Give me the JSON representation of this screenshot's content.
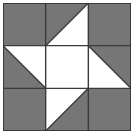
{
  "artwork": {
    "title": "Pinwheel Star Quilt Block",
    "type": "quilt-block-diagram",
    "grid_rows": 3,
    "grid_columns": 3,
    "background_color": "#ffffff",
    "patch_color": "#767676",
    "negative_color": "#ffffff",
    "grid_line_color": "#3a3a3a",
    "outer_border_color": "#2e2e2e",
    "canvas_width": 137,
    "canvas_height": 140,
    "block_left": 3,
    "block_top": 3,
    "block_size": 128,
    "cell_size": 42.667,
    "grid_line_width": 1.4,
    "outer_border_width": 1.6
  },
  "cells": [
    {
      "id": "cell-r1c1",
      "row": 1,
      "column": 1,
      "position_name": "top-left",
      "fill_type": "solid",
      "fill_color": "#767676",
      "description": "solid gray square"
    },
    {
      "id": "cell-r1c2",
      "row": 1,
      "column": 2,
      "position_name": "top-center",
      "fill_type": "half-square-triangle",
      "fill_color": "#767676",
      "triangle_corner": "top-left",
      "diagonal": "bottom-left-to-top-right",
      "description": "gray triangle upper-left, white lower-right"
    },
    {
      "id": "cell-r1c3",
      "row": 1,
      "column": 3,
      "position_name": "top-right",
      "fill_type": "solid",
      "fill_color": "#767676",
      "description": "solid gray square"
    },
    {
      "id": "cell-r2c1",
      "row": 2,
      "column": 1,
      "position_name": "middle-left",
      "fill_type": "half-square-triangle",
      "fill_color": "#767676",
      "triangle_corner": "bottom-left",
      "diagonal": "top-left-to-bottom-right",
      "description": "gray triangle lower-left, white upper-right"
    },
    {
      "id": "cell-r2c2",
      "row": 2,
      "column": 2,
      "position_name": "center",
      "fill_type": "solid",
      "fill_color": "#ffffff",
      "description": "solid white square"
    },
    {
      "id": "cell-r2c3",
      "row": 2,
      "column": 3,
      "position_name": "middle-right",
      "fill_type": "half-square-triangle",
      "fill_color": "#767676",
      "triangle_corner": "top-right",
      "diagonal": "top-left-to-bottom-right",
      "description": "gray triangle upper-right, white lower-left"
    },
    {
      "id": "cell-r3c1",
      "row": 3,
      "column": 1,
      "position_name": "bottom-left",
      "fill_type": "solid",
      "fill_color": "#767676",
      "description": "solid gray square"
    },
    {
      "id": "cell-r3c2",
      "row": 3,
      "column": 2,
      "position_name": "bottom-center",
      "fill_type": "half-square-triangle",
      "fill_color": "#767676",
      "triangle_corner": "bottom-right",
      "diagonal": "bottom-left-to-top-right",
      "description": "white triangle upper-left, gray lower-right"
    },
    {
      "id": "cell-r3c3",
      "row": 3,
      "column": 3,
      "position_name": "bottom-right",
      "fill_type": "solid",
      "fill_color": "#767676",
      "description": "solid gray square"
    }
  ]
}
